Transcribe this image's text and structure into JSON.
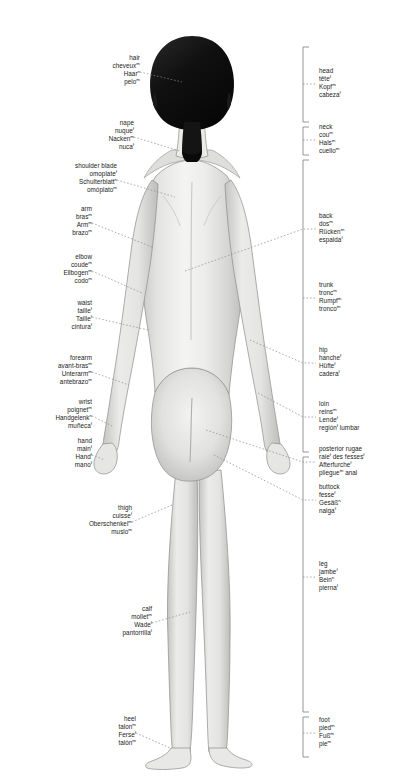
{
  "figure": {
    "colors": {
      "background": "#ffffff",
      "skin_light": "#f2f2f0",
      "skin_mid": "#dcdcda",
      "skin_shadow": "#b9b9b7",
      "outline": "#8d8d8b",
      "hair_dark": "#111111",
      "hair_mid": "#1d1d1d",
      "leader_line": "#8a8a8a",
      "bracket": "#8a8a8a",
      "text": "#222222"
    }
  },
  "labels_left": [
    {
      "id": "hair",
      "terms": [
        {
          "text": "hair",
          "gender": ""
        },
        {
          "text": "cheveux",
          "gender": "m"
        },
        {
          "text": "Haar",
          "gender": "n"
        },
        {
          "text": "pelo",
          "gender": "m"
        }
      ]
    },
    {
      "id": "nape",
      "terms": [
        {
          "text": "nape",
          "gender": ""
        },
        {
          "text": "nuque",
          "gender": "f"
        },
        {
          "text": "Nacken",
          "gender": "m"
        },
        {
          "text": "nuca",
          "gender": "f"
        }
      ]
    },
    {
      "id": "shoulder-blade",
      "terms": [
        {
          "text": "shoulder blade",
          "gender": ""
        },
        {
          "text": "omoplate",
          "gender": "f"
        },
        {
          "text": "Schulterblatt",
          "gender": "n"
        },
        {
          "text": "omóplato",
          "gender": "m"
        }
      ]
    },
    {
      "id": "arm",
      "terms": [
        {
          "text": "arm",
          "gender": ""
        },
        {
          "text": "bras",
          "gender": "m"
        },
        {
          "text": "Arm",
          "gender": "m"
        },
        {
          "text": "brazo",
          "gender": "m"
        }
      ]
    },
    {
      "id": "elbow",
      "terms": [
        {
          "text": "elbow",
          "gender": ""
        },
        {
          "text": "coude",
          "gender": "m"
        },
        {
          "text": "Ellbogen",
          "gender": "m"
        },
        {
          "text": "codo",
          "gender": "m"
        }
      ]
    },
    {
      "id": "waist",
      "terms": [
        {
          "text": "waist",
          "gender": ""
        },
        {
          "text": "taille",
          "gender": "f"
        },
        {
          "text": "Taille",
          "gender": "f"
        },
        {
          "text": "cintura",
          "gender": "f"
        }
      ]
    },
    {
      "id": "forearm",
      "terms": [
        {
          "text": "forearm",
          "gender": ""
        },
        {
          "text": "avant-bras",
          "gender": "m"
        },
        {
          "text": "Unterarm",
          "gender": "m"
        },
        {
          "text": "antebrazo",
          "gender": "m"
        }
      ]
    },
    {
      "id": "wrist",
      "terms": [
        {
          "text": "wrist",
          "gender": ""
        },
        {
          "text": "poignet",
          "gender": "m"
        },
        {
          "text": "Handgelenk",
          "gender": "n"
        },
        {
          "text": "muñeca",
          "gender": "f"
        }
      ]
    },
    {
      "id": "hand",
      "terms": [
        {
          "text": "hand",
          "gender": ""
        },
        {
          "text": "main",
          "gender": "f"
        },
        {
          "text": "Hand",
          "gender": "f"
        },
        {
          "text": "mano",
          "gender": "f"
        }
      ]
    },
    {
      "id": "thigh",
      "terms": [
        {
          "text": "thigh",
          "gender": ""
        },
        {
          "text": "cuisse",
          "gender": "f"
        },
        {
          "text": "Oberschenkel",
          "gender": "m"
        },
        {
          "text": "muslo",
          "gender": "m"
        }
      ]
    },
    {
      "id": "calf",
      "terms": [
        {
          "text": "calf",
          "gender": ""
        },
        {
          "text": "mollet",
          "gender": "m"
        },
        {
          "text": "Wade",
          "gender": "f"
        },
        {
          "text": "pantorrilla",
          "gender": "f"
        }
      ]
    },
    {
      "id": "heel",
      "terms": [
        {
          "text": "heel",
          "gender": ""
        },
        {
          "text": "talon",
          "gender": "m"
        },
        {
          "text": "Ferse",
          "gender": "f"
        },
        {
          "text": "talón",
          "gender": "m"
        }
      ]
    }
  ],
  "labels_right": [
    {
      "id": "head",
      "terms": [
        {
          "text": "head",
          "gender": ""
        },
        {
          "text": "tête",
          "gender": "f"
        },
        {
          "text": "Kopf",
          "gender": "m"
        },
        {
          "text": "cabeza",
          "gender": "f"
        }
      ]
    },
    {
      "id": "neck",
      "terms": [
        {
          "text": "neck",
          "gender": ""
        },
        {
          "text": "cou",
          "gender": "m"
        },
        {
          "text": "Hals",
          "gender": "m"
        },
        {
          "text": "cuello",
          "gender": "m"
        }
      ]
    },
    {
      "id": "back",
      "terms": [
        {
          "text": "back",
          "gender": ""
        },
        {
          "text": "dos",
          "gender": "m"
        },
        {
          "text": "Rücken",
          "gender": "m"
        },
        {
          "text": "espalda",
          "gender": "f"
        }
      ]
    },
    {
      "id": "trunk",
      "terms": [
        {
          "text": "trunk",
          "gender": ""
        },
        {
          "text": "tronc",
          "gender": "m"
        },
        {
          "text": "Rumpf",
          "gender": "m"
        },
        {
          "text": "tronco",
          "gender": "m"
        }
      ]
    },
    {
      "id": "hip",
      "terms": [
        {
          "text": "hip",
          "gender": ""
        },
        {
          "text": "hanche",
          "gender": "f"
        },
        {
          "text": "Hüfte",
          "gender": "f"
        },
        {
          "text": "cadera",
          "gender": "f"
        }
      ]
    },
    {
      "id": "loin",
      "terms": [
        {
          "text": "loin",
          "gender": ""
        },
        {
          "text": "reins",
          "gender": "m"
        },
        {
          "text": "Lende",
          "gender": "f"
        },
        {
          "text": "región",
          "gender": "f",
          "suffix": " lumbar"
        }
      ]
    },
    {
      "id": "posterior-rugae",
      "terms": [
        {
          "text": "posterior rugae",
          "gender": ""
        },
        {
          "text": "raie",
          "gender": "f",
          "suffix": " des fesses",
          "gender2": "f"
        },
        {
          "text": "Afterfurche",
          "gender": "f"
        },
        {
          "text": "pliegue",
          "gender": "m",
          "suffix": " anal"
        }
      ]
    },
    {
      "id": "buttock",
      "terms": [
        {
          "text": "buttock",
          "gender": ""
        },
        {
          "text": "fesse",
          "gender": "f"
        },
        {
          "text": "Gesäß",
          "gender": "n"
        },
        {
          "text": "nalga",
          "gender": "f"
        }
      ]
    },
    {
      "id": "leg",
      "terms": [
        {
          "text": "leg",
          "gender": ""
        },
        {
          "text": "jambe",
          "gender": "f"
        },
        {
          "text": "Bein",
          "gender": "n"
        },
        {
          "text": "pierna",
          "gender": "f"
        }
      ]
    },
    {
      "id": "foot",
      "terms": [
        {
          "text": "foot",
          "gender": ""
        },
        {
          "text": "pied",
          "gender": "m"
        },
        {
          "text": "Fuß",
          "gender": "m"
        },
        {
          "text": "pie",
          "gender": "m"
        }
      ]
    }
  ]
}
